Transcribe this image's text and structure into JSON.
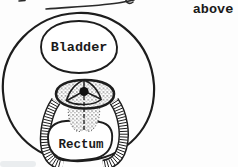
{
  "diagram": {
    "labels": {
      "bladder": "Bladder",
      "rectum": "Rectum"
    },
    "annotation": "above",
    "colors": {
      "ink": "#1d1d1d",
      "paper": "#fdfdfd"
    }
  }
}
